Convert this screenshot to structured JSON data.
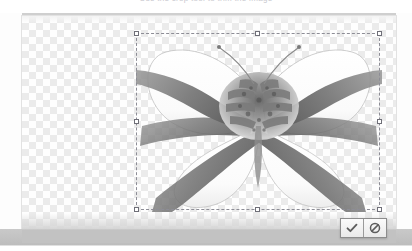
{
  "app": {
    "title": "Image Editor Canvas",
    "top_text": "Use the crop tool to trim the image",
    "mode": "transform-selection"
  },
  "canvas": {
    "background": "checkerboard-transparency",
    "checker_color_light": "#ffffff",
    "checker_color_dark": "#e9e9e9",
    "checker_size_px": 7,
    "border_color": "#e2e2e2"
  },
  "artwork": {
    "name": "butterfly-of-hands",
    "description": "Grayscale photographic montage of hands and arms arranged into a butterfly silhouette",
    "wing_color": "#ffffff",
    "ink_color": "#6b6b6b",
    "alt": "butterfly formed from hands"
  },
  "selection": {
    "label": "transform-selection",
    "dash_color": "#8d8d96",
    "handle_fill": "#ffffff",
    "handle_stroke": "#6f6f78",
    "handles": [
      "nw",
      "n",
      "ne",
      "w",
      "e",
      "sw",
      "s",
      "se"
    ]
  },
  "confirm_bar": {
    "confirm_label": "✓",
    "confirm_name": "Apply",
    "cancel_label": "⃠",
    "cancel_name": "Cancel",
    "accent": "#5d5d5d"
  },
  "status_bar": {
    "background": "#c2c2c2",
    "text": ""
  }
}
